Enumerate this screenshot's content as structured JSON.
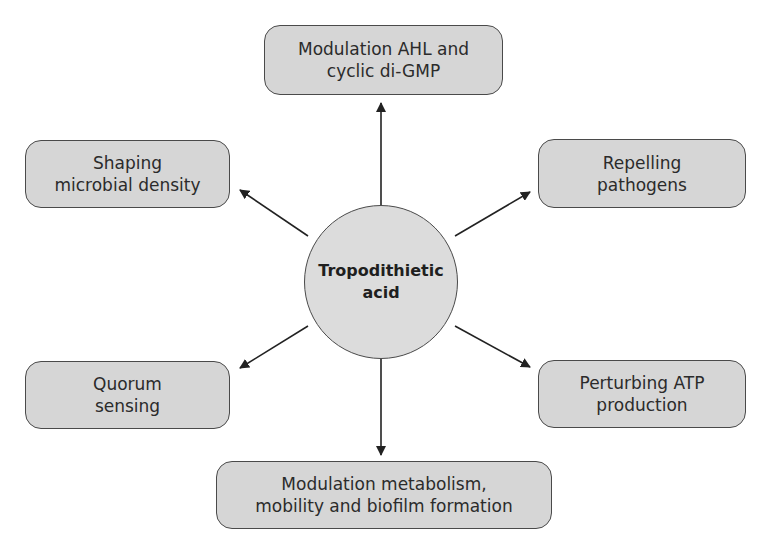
{
  "diagram": {
    "center": {
      "line1": "Tropodithietic",
      "line2": "acid"
    },
    "nodes": {
      "top": {
        "line1": "Modulation AHL and",
        "line2": "cyclic di-GMP"
      },
      "upper_left": {
        "line1": "Shaping",
        "line2": "microbial density"
      },
      "upper_right": {
        "line1": "Repelling",
        "line2": "pathogens"
      },
      "lower_left": {
        "line1": "Quorum",
        "line2": "sensing"
      },
      "lower_right": {
        "line1": "Perturbing ATP",
        "line2": "production"
      },
      "bottom": {
        "line1": "Modulation metabolism,",
        "line2": "mobility and biofilm formation"
      }
    },
    "colors": {
      "box_fill": "#d6d6d6",
      "circle_fill": "#dcdcdc",
      "stroke": "#4a4a4a",
      "arrow": "#222222",
      "text": "#2b2b2b"
    }
  }
}
